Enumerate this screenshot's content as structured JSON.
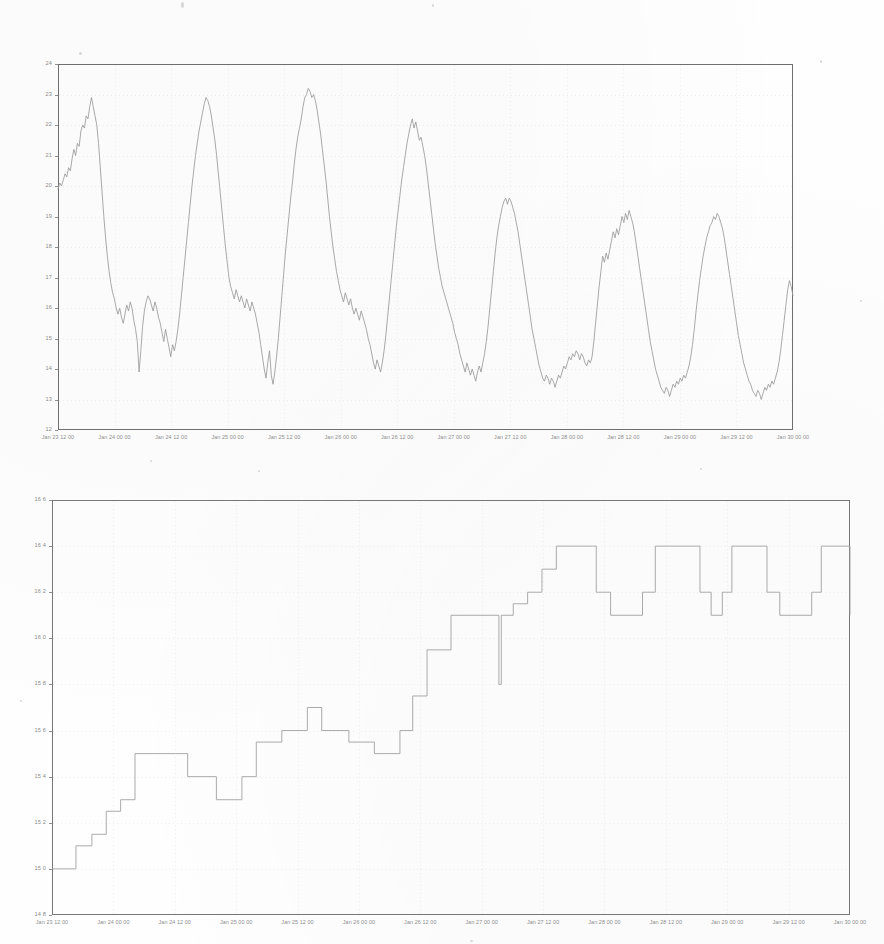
{
  "document": {
    "kind": "scanned-figure-page",
    "background_color": "#fefefe",
    "ink_color": "#8a8a8a",
    "frame_color": "#6f6f6f"
  },
  "chart_data": [
    {
      "id": "top-chart",
      "type": "line",
      "title": "",
      "xlabel": "",
      "ylabel": "",
      "ylim": [
        12,
        24
      ],
      "ytick_step": 1,
      "yticks": [
        "24",
        "23",
        "22",
        "21",
        "20",
        "19",
        "18",
        "17",
        "16",
        "15",
        "14",
        "13",
        "12"
      ],
      "xlim": [
        "Jan 23 12 00",
        "Jan 30 00 00"
      ],
      "xticks": [
        "Jan 23 12 00",
        "Jan 24 00 00",
        "Jan 24 12 00",
        "Jan 25 00 00",
        "Jan 25 12 00",
        "Jan 26 00 00",
        "Jan 26 12 00",
        "Jan 27 00 00",
        "Jan 27 12 00",
        "Jan 28 00 00",
        "Jan 28 12 00",
        "Jan 29 00 00",
        "Jan 29 12 00",
        "Jan 30 00 00"
      ],
      "grid": true,
      "legend": null,
      "series": [
        {
          "name": "temperature",
          "color": "#9a9a9a",
          "values": [
            19.9,
            20.1,
            20.0,
            20.2,
            20.4,
            20.3,
            20.6,
            20.5,
            20.9,
            21.2,
            21.0,
            21.4,
            21.3,
            21.8,
            22.0,
            21.9,
            22.3,
            22.2,
            22.6,
            22.9,
            22.6,
            22.3,
            22.0,
            21.4,
            20.6,
            19.8,
            19.0,
            18.3,
            17.7,
            17.2,
            16.8,
            16.5,
            16.3,
            16.0,
            15.8,
            16.0,
            15.7,
            15.5,
            15.8,
            16.1,
            15.9,
            16.2,
            16.0,
            15.6,
            15.3,
            14.9,
            13.9,
            14.6,
            15.4,
            15.9,
            16.2,
            16.4,
            16.3,
            16.1,
            15.9,
            16.2,
            16.0,
            15.7,
            15.5,
            15.2,
            14.9,
            15.3,
            15.0,
            14.7,
            14.4,
            14.8,
            14.6,
            14.9,
            15.3,
            15.8,
            16.4,
            17.0,
            17.6,
            18.2,
            18.8,
            19.4,
            20.0,
            20.5,
            21.0,
            21.4,
            21.8,
            22.1,
            22.4,
            22.7,
            22.9,
            22.8,
            22.6,
            22.3,
            21.9,
            21.5,
            21.0,
            20.4,
            19.8,
            19.2,
            18.6,
            18.0,
            17.5,
            17.0,
            16.7,
            16.5,
            16.3,
            16.6,
            16.4,
            16.2,
            16.4,
            16.2,
            16.0,
            16.3,
            16.1,
            15.9,
            16.2,
            16.0,
            15.8,
            15.5,
            15.2,
            14.8,
            14.4,
            14.0,
            13.7,
            14.2,
            14.6,
            13.8,
            13.5,
            13.9,
            14.4,
            15.0,
            15.7,
            16.4,
            17.1,
            17.8,
            18.4,
            19.0,
            19.6,
            20.1,
            20.7,
            21.2,
            21.6,
            21.9,
            22.2,
            22.6,
            22.9,
            23.0,
            23.2,
            23.1,
            22.9,
            23.0,
            22.8,
            22.5,
            22.1,
            21.7,
            21.2,
            20.7,
            20.2,
            19.6,
            19.0,
            18.5,
            18.0,
            17.6,
            17.2,
            16.9,
            16.6,
            16.4,
            16.2,
            16.5,
            16.3,
            16.1,
            16.3,
            16.0,
            15.8,
            16.0,
            15.8,
            15.6,
            15.9,
            15.7,
            15.5,
            15.3,
            15.0,
            14.8,
            14.5,
            14.2,
            14.0,
            14.3,
            14.1,
            13.9,
            14.2,
            14.6,
            15.1,
            15.7,
            16.3,
            16.9,
            17.5,
            18.1,
            18.7,
            19.2,
            19.7,
            20.2,
            20.6,
            21.0,
            21.4,
            21.7,
            22.0,
            22.2,
            21.9,
            22.1,
            21.8,
            21.5,
            21.6,
            21.3,
            21.0,
            20.6,
            20.1,
            19.6,
            19.1,
            18.6,
            18.1,
            17.7,
            17.3,
            17.0,
            16.7,
            16.5,
            16.3,
            16.1,
            15.9,
            15.7,
            15.5,
            15.2,
            15.0,
            14.8,
            14.5,
            14.3,
            14.1,
            13.9,
            14.2,
            14.0,
            13.8,
            14.0,
            13.8,
            13.6,
            13.9,
            14.1,
            13.9,
            14.2,
            14.5,
            14.9,
            15.4,
            16.0,
            16.6,
            17.2,
            17.8,
            18.3,
            18.7,
            19.0,
            19.3,
            19.5,
            19.6,
            19.4,
            19.6,
            19.5,
            19.3,
            19.1,
            18.8,
            18.5,
            18.1,
            17.7,
            17.3,
            16.9,
            16.5,
            16.1,
            15.7,
            15.3,
            15.0,
            14.7,
            14.4,
            14.1,
            13.9,
            13.7,
            13.6,
            13.8,
            13.7,
            13.5,
            13.7,
            13.6,
            13.4,
            13.6,
            13.8,
            13.7,
            13.9,
            14.1,
            14.0,
            14.2,
            14.4,
            14.3,
            14.5,
            14.4,
            14.6,
            14.5,
            14.3,
            14.5,
            14.4,
            14.2,
            14.1,
            14.3,
            14.2,
            14.4,
            14.9,
            15.5,
            16.1,
            16.7,
            17.2,
            17.7,
            17.5,
            17.8,
            17.6,
            17.9,
            18.2,
            18.5,
            18.3,
            18.6,
            18.4,
            18.7,
            19.0,
            18.8,
            19.1,
            18.9,
            19.2,
            19.0,
            18.8,
            18.5,
            18.1,
            17.7,
            17.3,
            16.9,
            16.5,
            16.1,
            15.7,
            15.3,
            14.9,
            14.6,
            14.3,
            14.0,
            13.8,
            13.6,
            13.4,
            13.3,
            13.2,
            13.4,
            13.3,
            13.1,
            13.3,
            13.5,
            13.4,
            13.6,
            13.5,
            13.7,
            13.6,
            13.8,
            13.7,
            13.9,
            14.1,
            14.4,
            14.8,
            15.3,
            15.9,
            16.4,
            16.9,
            17.3,
            17.7,
            18.0,
            18.3,
            18.5,
            18.7,
            18.8,
            19.0,
            18.9,
            19.1,
            19.0,
            18.8,
            18.6,
            18.3,
            17.9,
            17.5,
            17.1,
            16.7,
            16.3,
            15.9,
            15.5,
            15.1,
            14.8,
            14.5,
            14.2,
            14.0,
            13.8,
            13.6,
            13.5,
            13.3,
            13.2,
            13.1,
            13.3,
            13.2,
            13.0,
            13.2,
            13.4,
            13.3,
            13.5,
            13.4,
            13.6,
            13.5,
            13.7,
            13.9,
            14.2,
            14.6,
            15.1,
            15.6,
            16.1,
            16.6,
            16.9,
            16.7,
            16.4
          ]
        }
      ]
    },
    {
      "id": "bottom-chart",
      "type": "line",
      "title": "",
      "xlabel": "",
      "ylabel": "",
      "ylim": [
        14.8,
        16.6
      ],
      "ytick_step": 0.2,
      "yticks": [
        "16 6",
        "16 4",
        "16 2",
        "16 0",
        "15 8",
        "15 6",
        "15 4",
        "15 2",
        "15 0",
        "14 8"
      ],
      "xlim": [
        "Jan 23 12 00",
        "Jan 30 00 00"
      ],
      "xticks": [
        "Jan 23 12 00",
        "Jan 24 00 00",
        "Jan 24 12 00",
        "Jan 25 00 00",
        "Jan 25 12 00",
        "Jan 26 00 00",
        "Jan 26 12 00",
        "Jan 27 00 00",
        "Jan 27 12 00",
        "Jan 28 00 00",
        "Jan 28 12 00",
        "Jan 29 00 00",
        "Jan 29 12 00",
        "Jan 30 00 00"
      ],
      "grid": true,
      "legend": null,
      "step_style": "post",
      "series": [
        {
          "name": "stepped-signal",
          "color": "#a0a0a0",
          "points": [
            [
              0.0,
              15.0
            ],
            [
              0.03,
              15.0
            ],
            [
              0.03,
              15.1
            ],
            [
              0.05,
              15.1
            ],
            [
              0.05,
              15.15
            ],
            [
              0.068,
              15.15
            ],
            [
              0.068,
              15.25
            ],
            [
              0.086,
              15.25
            ],
            [
              0.086,
              15.3
            ],
            [
              0.104,
              15.3
            ],
            [
              0.104,
              15.5
            ],
            [
              0.17,
              15.5
            ],
            [
              0.17,
              15.4
            ],
            [
              0.206,
              15.4
            ],
            [
              0.206,
              15.3
            ],
            [
              0.238,
              15.3
            ],
            [
              0.238,
              15.4
            ],
            [
              0.256,
              15.4
            ],
            [
              0.256,
              15.55
            ],
            [
              0.288,
              15.55
            ],
            [
              0.288,
              15.6
            ],
            [
              0.32,
              15.6
            ],
            [
              0.32,
              15.7
            ],
            [
              0.338,
              15.7
            ],
            [
              0.338,
              15.6
            ],
            [
              0.372,
              15.6
            ],
            [
              0.372,
              15.55
            ],
            [
              0.404,
              15.55
            ],
            [
              0.404,
              15.5
            ],
            [
              0.436,
              15.5
            ],
            [
              0.436,
              15.6
            ],
            [
              0.452,
              15.6
            ],
            [
              0.452,
              15.75
            ],
            [
              0.47,
              15.75
            ],
            [
              0.47,
              15.95
            ],
            [
              0.5,
              15.95
            ],
            [
              0.5,
              16.1
            ],
            [
              0.56,
              16.1
            ],
            [
              0.56,
              15.8
            ],
            [
              0.563,
              15.8
            ],
            [
              0.563,
              16.1
            ],
            [
              0.578,
              16.1
            ],
            [
              0.578,
              16.15
            ],
            [
              0.596,
              16.15
            ],
            [
              0.596,
              16.2
            ],
            [
              0.614,
              16.2
            ],
            [
              0.614,
              16.3
            ],
            [
              0.632,
              16.3
            ],
            [
              0.632,
              16.4
            ],
            [
              0.682,
              16.4
            ],
            [
              0.682,
              16.2
            ],
            [
              0.7,
              16.2
            ],
            [
              0.7,
              16.1
            ],
            [
              0.74,
              16.1
            ],
            [
              0.74,
              16.2
            ],
            [
              0.756,
              16.2
            ],
            [
              0.756,
              16.4
            ],
            [
              0.812,
              16.4
            ],
            [
              0.812,
              16.2
            ],
            [
              0.826,
              16.2
            ],
            [
              0.826,
              16.1
            ],
            [
              0.84,
              16.1
            ],
            [
              0.84,
              16.2
            ],
            [
              0.852,
              16.2
            ],
            [
              0.852,
              16.4
            ],
            [
              0.896,
              16.4
            ],
            [
              0.896,
              16.2
            ],
            [
              0.912,
              16.2
            ],
            [
              0.912,
              16.1
            ],
            [
              0.952,
              16.1
            ],
            [
              0.952,
              16.2
            ],
            [
              0.964,
              16.2
            ],
            [
              0.964,
              16.4
            ],
            [
              1.0,
              16.4
            ],
            [
              1.0,
              16.2
            ],
            [
              1.012,
              16.2
            ],
            [
              1.012,
              16.1
            ]
          ]
        }
      ]
    }
  ]
}
